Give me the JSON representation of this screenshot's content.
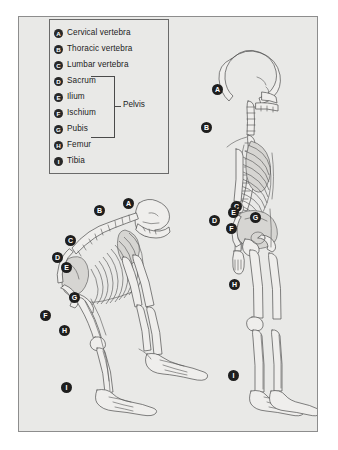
{
  "figure": {
    "panel_bg": "#e9e9e7",
    "panel_border": "#8d8d8d",
    "badge_bg": "#1e1e1e",
    "badge_fg": "#ffffff"
  },
  "legend": {
    "bracket_label": "Pelvis",
    "items": [
      {
        "key": "A",
        "label": "Cervical vertebra"
      },
      {
        "key": "B",
        "label": "Thoracic vertebra"
      },
      {
        "key": "C",
        "label": "Lumbar vertebra"
      },
      {
        "key": "D",
        "label": "Sacrum"
      },
      {
        "key": "E",
        "label": "Ilium"
      },
      {
        "key": "F",
        "label": "Ischium"
      },
      {
        "key": "G",
        "label": "Pubis"
      },
      {
        "key": "H",
        "label": "Femur"
      },
      {
        "key": "I",
        "label": "Tibia"
      }
    ]
  },
  "ape_skeleton": {
    "name": "ape-skeleton",
    "labels": [
      {
        "key": "A",
        "x": 128,
        "y": 203
      },
      {
        "key": "B",
        "x": 99,
        "y": 210
      },
      {
        "key": "C",
        "x": 70,
        "y": 240
      },
      {
        "key": "D",
        "x": 57,
        "y": 257
      },
      {
        "key": "E",
        "x": 66,
        "y": 267
      },
      {
        "key": "F",
        "x": 45,
        "y": 315
      },
      {
        "key": "G",
        "x": 74,
        "y": 297
      },
      {
        "key": "H",
        "x": 64,
        "y": 330
      },
      {
        "key": "I",
        "x": 66,
        "y": 387
      }
    ]
  },
  "human_skeleton": {
    "name": "human-skeleton",
    "labels": [
      {
        "key": "A",
        "x": 217,
        "y": 89
      },
      {
        "key": "B",
        "x": 206,
        "y": 127
      },
      {
        "key": "C",
        "x": 236,
        "y": 206
      },
      {
        "key": "D",
        "x": 214,
        "y": 220
      },
      {
        "key": "E",
        "x": 233,
        "y": 212
      },
      {
        "key": "F",
        "x": 231,
        "y": 228
      },
      {
        "key": "G",
        "x": 255,
        "y": 217
      },
      {
        "key": "H",
        "x": 234,
        "y": 284
      },
      {
        "key": "I",
        "x": 233,
        "y": 375
      }
    ]
  }
}
